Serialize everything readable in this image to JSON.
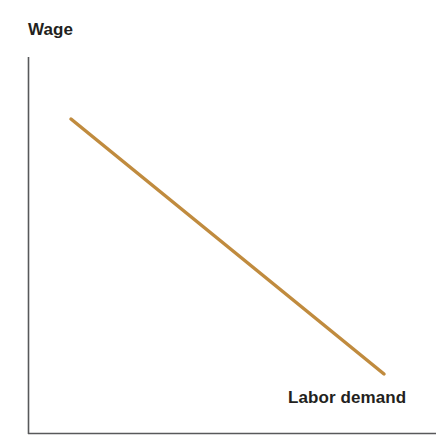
{
  "figure": {
    "width": 442,
    "height": 445,
    "background": "#ffffff"
  },
  "labels": {
    "y_axis_title": "Wage",
    "curve_label": "Labor demand"
  },
  "colors": {
    "curve": "#c08b3e",
    "axis": "#58595b",
    "text": "#231f20",
    "background": "#ffffff"
  },
  "chart_data": {
    "type": "line",
    "title": "",
    "xlabel": "",
    "ylabel": "Wage",
    "grid": false,
    "legend": "inline-curve-label",
    "axes": {
      "y_axis": {
        "label": "Wage",
        "ticks": [],
        "tick_labels": [],
        "arrow": false
      },
      "x_axis": {
        "label": "",
        "ticks": [],
        "tick_labels": [],
        "arrow": false
      }
    },
    "annotations": [
      {
        "text": "Labor demand",
        "x_px": 288,
        "y_px": 398,
        "bold": true
      }
    ],
    "series": [
      {
        "name": "Labor demand",
        "color": "#c08b3e",
        "linewidth_px": 3.5,
        "description": "Downward-sloping straight labor demand curve",
        "points_px": [
          [
            71,
            119
          ],
          [
            384,
            374
          ]
        ],
        "x": [
          0.14,
          0.87
        ],
        "values": [
          0.83,
          0.16
        ]
      }
    ],
    "xlim": [
      0,
      1
    ],
    "ylim": [
      0,
      1
    ]
  }
}
